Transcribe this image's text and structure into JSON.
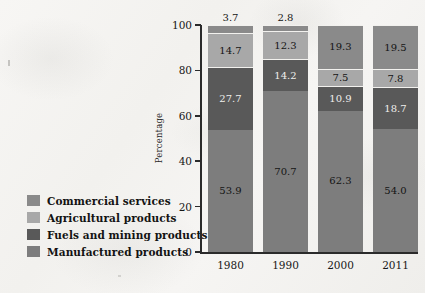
{
  "chart_data": {
    "type": "bar",
    "stacked": true,
    "title": "",
    "xlabel": "",
    "ylabel": "Percentage",
    "categories": [
      "1980",
      "1990",
      "2000",
      "2011"
    ],
    "ylim": [
      0,
      100
    ],
    "yticks": [
      0,
      20,
      40,
      60,
      80,
      100
    ],
    "ytick_labels": [
      "0",
      "20",
      "40",
      "60",
      "80",
      "100"
    ],
    "grid": false,
    "legend_position": "left",
    "stack_order_bottom_to_top": [
      "Manufactured products",
      "Fuels and mining products",
      "Agricultural products",
      "Commercial services"
    ],
    "series": [
      {
        "name": "Manufactured products",
        "color": "#7d7d7d",
        "values": [
          53.9,
          70.7,
          62.3,
          54.0
        ],
        "labels": [
          "53.9",
          "70.7",
          "62.3",
          "54.0"
        ]
      },
      {
        "name": "Fuels and mining products",
        "color": "#595959",
        "values": [
          27.7,
          14.2,
          10.9,
          18.7
        ],
        "labels": [
          "27.7",
          "14.2",
          "10.9",
          "18.7"
        ]
      },
      {
        "name": "Agricultural products",
        "color": "#a8a8a8",
        "values": [
          14.7,
          12.3,
          7.5,
          7.8
        ],
        "labels": [
          "14.7",
          "12.3",
          "7.5",
          "7.8"
        ]
      },
      {
        "name": "Commercial services",
        "color": "#8a8a8a",
        "values": [
          3.7,
          2.8,
          19.3,
          19.5
        ],
        "labels": [
          "3.7",
          "2.8",
          "19.3",
          "19.5"
        ],
        "label_placement": [
          "above-bar",
          "above-bar",
          "inside",
          "inside"
        ]
      }
    ]
  },
  "legend": {
    "items": [
      {
        "label": "Commercial services",
        "color": "#8a8a8a"
      },
      {
        "label": "Agricultural products",
        "color": "#a8a8a8"
      },
      {
        "label": "Fuels and mining products",
        "color": "#595959"
      },
      {
        "label": "Manufactured products",
        "color": "#7d7d7d"
      }
    ]
  },
  "axes": {
    "y_title": "Percentage",
    "y_labels": [
      "100",
      "80",
      "60",
      "40",
      "20",
      "0"
    ],
    "x_labels": [
      "1980",
      "1990",
      "2000",
      "2011"
    ]
  },
  "colors": {
    "background": "#f4f3f1",
    "axis": "#2b2b2b",
    "text": "#141414"
  }
}
